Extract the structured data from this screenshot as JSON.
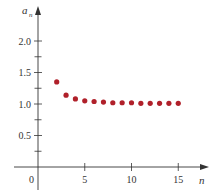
{
  "chart_data": {
    "type": "scatter",
    "title": "",
    "xlabel": "n",
    "ylabel": "a_n",
    "ylabel_main": "a",
    "ylabel_sub": "n",
    "origin_label": "0",
    "x": [
      2,
      3,
      4,
      5,
      6,
      7,
      8,
      9,
      10,
      11,
      12,
      13,
      14,
      15
    ],
    "values": [
      1.35,
      1.14,
      1.08,
      1.05,
      1.04,
      1.03,
      1.02,
      1.02,
      1.02,
      1.01,
      1.01,
      1.01,
      1.01,
      1.01
    ],
    "xlim": [
      0,
      16
    ],
    "ylim": [
      0,
      2.2
    ],
    "x_ticks": [
      5,
      10,
      15
    ],
    "x_tick_labels": [
      "5",
      "10",
      "15"
    ],
    "y_ticks": [
      0.5,
      1.0,
      1.5,
      2.0
    ],
    "y_tick_labels": [
      "0.5",
      "1.0",
      "1.5",
      "2.0"
    ],
    "y_minor_ticks": [
      0.25,
      0.75,
      1.25,
      1.75
    ],
    "grid": false,
    "legend": null,
    "point_color": "#b0202a",
    "axis_color": "#333333"
  }
}
